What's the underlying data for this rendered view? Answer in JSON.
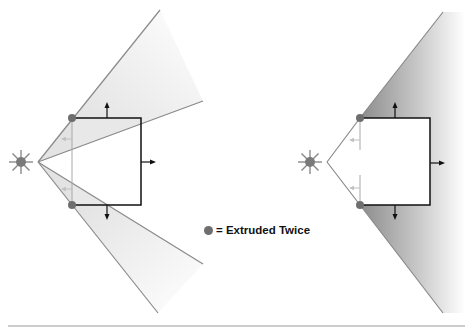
{
  "legend": {
    "marker": "dot",
    "marker_color": "#6e6e6e",
    "text": "= Extruded Twice"
  },
  "colors": {
    "ray": "#8a8a8a",
    "box_edge": "#111111",
    "shadow_light": "#e6e6e6",
    "shadow_dark": "#8c8c8c",
    "light_source": "#7a7a7a",
    "faint_arrow": "#bdbdbd",
    "bottom_rule": "#cccccc"
  },
  "diagrams": [
    {
      "name": "left",
      "description": "Light source casting shadow volume with per-edge extrusion; silhouette corner vertices extruded twice"
    },
    {
      "name": "right",
      "description": "Light source casting merged shadow volume from silhouette corners"
    }
  ]
}
